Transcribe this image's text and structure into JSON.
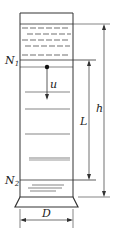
{
  "diagram": {
    "labels": {
      "n1": "N",
      "n1_sub": "1",
      "n2": "N",
      "n2_sub": "2",
      "u": "u",
      "L": "L",
      "h": "h",
      "D": "D"
    },
    "colors": {
      "line": "#333333",
      "background": "#ffffff"
    }
  }
}
